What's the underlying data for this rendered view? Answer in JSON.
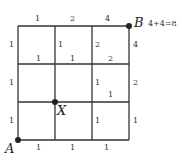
{
  "diagram": {
    "type": "lattice-path-grid",
    "grid": {
      "cols": 3,
      "rows": 3,
      "line_color": "#333333"
    },
    "points": {
      "A": {
        "label": "A"
      },
      "B": {
        "label": "B",
        "annotation": "4+4=8"
      },
      "X": {
        "label": "X"
      }
    },
    "edge_labels": {
      "top_row": [
        "1",
        "2",
        "4"
      ],
      "row1_vertical": [
        "1",
        "1",
        "2",
        "4"
      ],
      "row1_bottom": [
        "1",
        "1",
        "2"
      ],
      "row2_vertical": [
        "1",
        "",
        "1",
        "2"
      ],
      "row2_bottom_inner": [
        "",
        "",
        "1"
      ],
      "row3_vertical": [
        "1",
        "",
        "1",
        "1"
      ],
      "bottom_row": [
        "1",
        "1",
        "1"
      ]
    }
  }
}
